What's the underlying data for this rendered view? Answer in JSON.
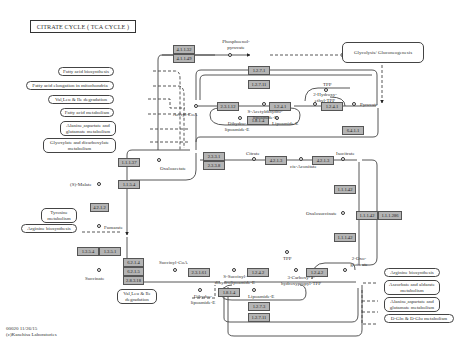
{
  "title": "CITRATE CYCLE ( TCA CYCLE )",
  "footer": {
    "line1": "00020 11/26/15",
    "line2": "(c)Kanehisa Laboratories"
  },
  "maps": {
    "fatty_acid_biosynthesis": "Fatty acid biosynthesis",
    "fatty_acid_elongation": "Fatty acid elongation in mitochondria",
    "val_leu_ile_top": "Val,Leu & Ile degradation",
    "fatty_acid_metabolism": "Fatty acid metabolism",
    "ala_asp_glu_left": "Alanine,aspartate and glutamate metabolism",
    "glyoxylate": "Glyoxylate and dicarboxylate metabolism",
    "tyrosine": "Tyrosine metabolism",
    "arginine_left": "Arginine biosynthesis",
    "val_leu_ile_bottom": "Val,Leu & Ile degradation",
    "glycolysis": "Glycolysis/ Gluconeogenesis",
    "arginine_right": "Arginine biosynthesis",
    "ascorbate": "Ascorbate and aldarate metabolism",
    "ala_asp_glu_right": "Alanine,aspartate and glutamate metabolism",
    "d_gln": "D-Gln & D-Glu metabolism"
  },
  "compounds": {
    "phosphoenolpyruvate": "Phosphoenol-pyruvate",
    "acetyl_coa": "Acetyl-CoA",
    "pyruvate": "Pyruvate",
    "tpp_top": "TPP",
    "hydroxyethyl_tpp": "2-Hydroxy-ethyl-TPP",
    "s_acetyldihydrolipoamide": "S-Acetyldihydro-lipoamide-E",
    "dihydrolipoamide_top": "Dihydro-lipoamide-E",
    "lipoamide_top": "Lipoamide-E",
    "oxaloacetate_left": "Oxaloacetate",
    "citrate": "Citrate",
    "cis_aconitate": "cis-Aconitate",
    "isocitrate": "Isocitrate",
    "oxalosuccinate": "Oxalosuccinate",
    "malate": "(S)-Malate",
    "fumarate": "Fumarate",
    "succinate": "Succinate",
    "succinyl_coa": "Succinyl-CoA",
    "s_succinyldihydrolipoamide": "S-Succinyl-dihydrolipoamide-E",
    "tpp_bottom": "TPP",
    "carboxy_hydroxypropyl_tpp": "3-Carboxy-1-hydroxypropyl-TPP",
    "oxoglutarate": "2-Oxo-glutarate",
    "dihydrolipoamide_bottom": "Dihydro-lipoamide-E",
    "lipoamide_bottom": "Lipoamide-E"
  },
  "enzymes": {
    "e4_1_1_32": "4.1.1.32",
    "e4_1_1_49": "4.1.1.49",
    "e1_2_7_1": "1.2.7.1",
    "e1_2_7_11": "1.2.7.11",
    "e2_3_1_12": "2.3.1.12",
    "e1_2_4_1_a": "1.2.4.1",
    "e1_2_4_1_b": "1.2.4.1",
    "e1_8_1_4_top": "1.8.1.4",
    "e6_4_1_1": "6.4.1.1",
    "e1_1_1_37": "1.1.1.37",
    "e1_1_5_4": "1.1.5.4",
    "e2_3_3_1": "2.3.3.1",
    "e2_3_3_8": "2.3.3.8",
    "e4_2_1_3_a": "4.2.1.3",
    "e4_2_1_3_b": "4.2.1.3",
    "e1_1_1_42_a": "1.1.1.42",
    "e1_1_1_42_b": "1.1.1.42",
    "e1_1_1_286": "1.1.1.286",
    "e1_1_1_42_c": "1.1.1.42",
    "e4_2_1_2": "4.2.1.2",
    "e1_3_5_4": "1.3.5.4",
    "e1_3_5_1": "1.3.5.1",
    "e6_2_1_4": "6.2.1.4",
    "e6_2_1_5": "6.2.1.5",
    "e2_8_3_18": "2.8.3.18",
    "e2_3_1_61": "2.3.1.61",
    "e1_2_4_2_a": "1.2.4.2",
    "e1_2_4_2_b": "1.2.4.2",
    "e1_8_1_4_bottom": "1.8.1.4",
    "e1_2_7_3": "1.2.7.3",
    "e1_2_7_11_b": "1.2.7.11"
  }
}
